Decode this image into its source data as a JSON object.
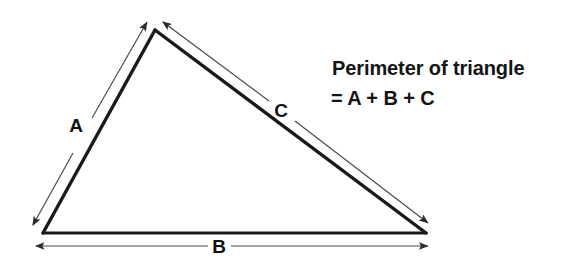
{
  "figure": {
    "kind": "geometry-diagram",
    "background_color": "#ffffff",
    "stroke_color": "#1a1a1a",
    "measure_color": "#3a3a3a",
    "text_color": "#141414"
  },
  "triangle": {
    "vertices": {
      "apex": {
        "x": 155,
        "y": 30
      },
      "bottom_left": {
        "x": 43,
        "y": 233
      },
      "bottom_right": {
        "x": 426,
        "y": 233
      }
    },
    "edges": [
      {
        "name": "A",
        "from": "bottom_left",
        "to": "apex"
      },
      {
        "name": "B",
        "from": "bottom_left",
        "to": "bottom_right"
      },
      {
        "name": "C",
        "from": "apex",
        "to": "bottom_right"
      }
    ]
  },
  "labels": {
    "side_a": "A",
    "side_b": "B",
    "side_c": "C"
  },
  "label_positions": {
    "side_a": {
      "x": 83,
      "y": 132
    },
    "side_b": {
      "x": 219,
      "y": 253
    },
    "side_c": {
      "x": 281,
      "y": 117
    }
  },
  "measure_arrows": [
    {
      "name": "measure-arrow-a",
      "label": "A",
      "start": {
        "x": 33,
        "y": 225
      },
      "end": {
        "x": 147,
        "y": 22
      },
      "double_headed": true
    },
    {
      "name": "measure-arrow-b",
      "label": "B",
      "start": {
        "x": 36,
        "y": 246
      },
      "end": {
        "x": 428,
        "y": 246
      },
      "double_headed": true
    },
    {
      "name": "measure-arrow-c",
      "label": "C",
      "start": {
        "x": 163,
        "y": 22
      },
      "end": {
        "x": 428,
        "y": 223
      },
      "double_headed": true
    }
  ],
  "formula": {
    "line_1": "Perimeter of triangle",
    "line_2": "= A + B + C"
  }
}
